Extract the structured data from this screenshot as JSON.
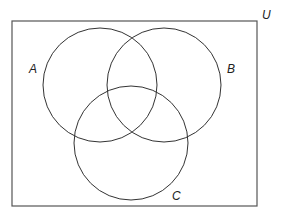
{
  "diagram": {
    "type": "venn",
    "universe_label": "U",
    "sets": [
      {
        "label": "A",
        "cx": 100,
        "cy": 85,
        "r": 57
      },
      {
        "label": "B",
        "cx": 164,
        "cy": 85,
        "r": 57
      },
      {
        "label": "C",
        "cx": 131,
        "cy": 143,
        "r": 57
      }
    ],
    "stroke_color": "#333333"
  }
}
